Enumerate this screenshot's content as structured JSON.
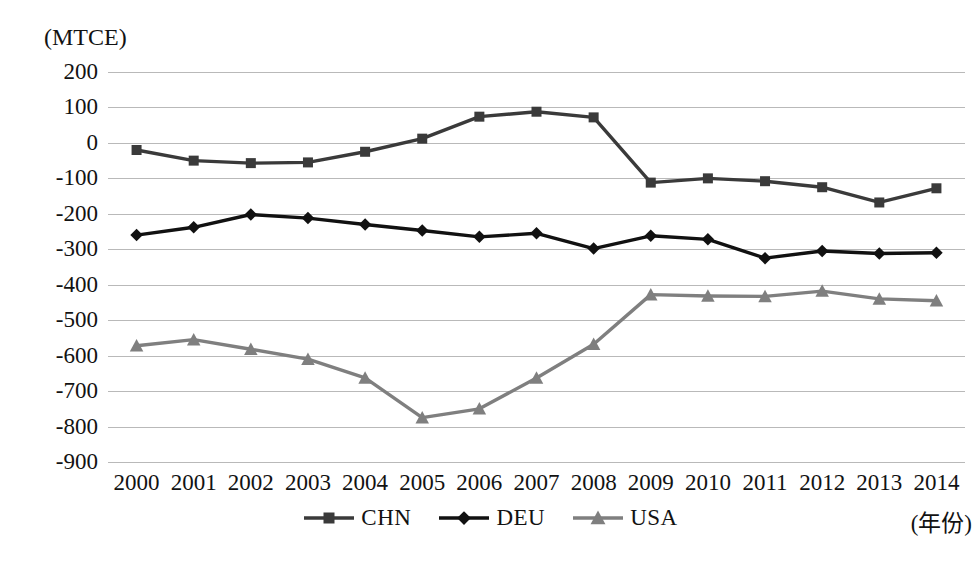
{
  "chart_data": {
    "type": "line",
    "title": "",
    "subtitle": "",
    "xlabel": "(年份)",
    "ylabel": "(MTCE)",
    "x": [
      2000,
      2001,
      2002,
      2003,
      2004,
      2005,
      2006,
      2007,
      2008,
      2009,
      2010,
      2011,
      2012,
      2013,
      2014
    ],
    "categories": [
      "2000",
      "2001",
      "2002",
      "2003",
      "2004",
      "2005",
      "2006",
      "2007",
      "2008",
      "2009",
      "2010",
      "2011",
      "2012",
      "2013",
      "2014"
    ],
    "ylim": [
      -900,
      200
    ],
    "ytick_values": [
      200,
      100,
      0,
      -100,
      -200,
      -300,
      -400,
      -500,
      -600,
      -700,
      -800,
      -900
    ],
    "ytick_labels": [
      "200",
      "100",
      "0",
      "-100",
      "-200",
      "-300",
      "-400",
      "-500",
      "-600",
      "-700",
      "-800",
      "-900"
    ],
    "grid": true,
    "legend_position": "bottom-center",
    "series": [
      {
        "name": "CHN",
        "marker": "square",
        "color": "#3a3a3a",
        "values": [
          -20,
          -50,
          -57,
          -55,
          -25,
          12,
          74,
          88,
          72,
          -112,
          -100,
          -108,
          -125,
          -168,
          -128
        ]
      },
      {
        "name": "DEU",
        "marker": "diamond",
        "color": "#111111",
        "values": [
          -260,
          -238,
          -202,
          -212,
          -230,
          -247,
          -265,
          -255,
          -298,
          -262,
          -272,
          -325,
          -305,
          -312,
          -310
        ]
      },
      {
        "name": "USA",
        "marker": "triangle",
        "color": "#7f7f7f",
        "values": [
          -572,
          -555,
          -582,
          -610,
          -663,
          -775,
          -750,
          -663,
          -568,
          -428,
          -432,
          -433,
          -418,
          -440,
          -445
        ]
      }
    ]
  },
  "legend": {
    "items": [
      {
        "label": "CHN",
        "marker": "square",
        "color": "#3a3a3a"
      },
      {
        "label": "DEU",
        "marker": "diamond",
        "color": "#111111"
      },
      {
        "label": "USA",
        "marker": "triangle",
        "color": "#7f7f7f"
      }
    ]
  },
  "axes": {
    "y_unit_caption": "(MTCE)",
    "x_unit_caption": "(年份)"
  },
  "colors": {
    "gridline": "#b9b9b9",
    "text": "#121212",
    "background": "#ffffff"
  }
}
